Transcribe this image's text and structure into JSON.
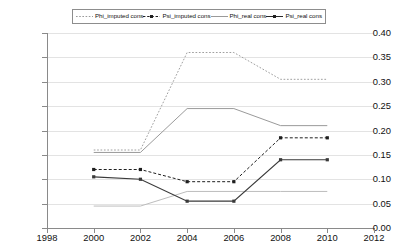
{
  "chart_data": {
    "type": "line",
    "title": "",
    "xlabel": "",
    "ylabel": "",
    "x": [
      2000,
      2002,
      2004,
      2006,
      2008,
      2010
    ],
    "xlim": [
      1998,
      2012
    ],
    "ylim": [
      0.0,
      0.4
    ],
    "xticks": [
      "1998",
      "2000",
      "2002",
      "2004",
      "2006",
      "2008",
      "2010",
      "2012"
    ],
    "xtick_values": [
      1998,
      2000,
      2002,
      2004,
      2006,
      2008,
      2010,
      2012
    ],
    "yticks": [
      "0.00",
      "0.05",
      "0.10",
      "0.15",
      "0.20",
      "0.25",
      "0.30",
      "0.35",
      "0.40"
    ],
    "ytick_values": [
      0.0,
      0.05,
      0.1,
      0.15,
      0.2,
      0.25,
      0.3,
      0.35,
      0.4
    ],
    "grid": true,
    "legend_position": "top-center",
    "series": [
      {
        "name": "Phi_imputed cons",
        "style": "dotted",
        "color": "#a0a0a0",
        "marker": "none",
        "values": [
          0.16,
          0.16,
          0.36,
          0.36,
          0.305,
          0.305
        ]
      },
      {
        "name": "Psi_imputed cons",
        "style": "dashed",
        "color": "#1f1f1f",
        "marker": "square",
        "values": [
          0.12,
          0.12,
          0.095,
          0.095,
          0.185,
          0.185
        ]
      },
      {
        "name": "Phi_real cons",
        "style": "solid-light",
        "color": "#bdbdbd",
        "marker": "none",
        "values": [
          0.045,
          0.045,
          0.075,
          0.075,
          0.075,
          0.075
        ]
      },
      {
        "name": "Psi_real cons",
        "style": "solid",
        "color": "#3a3a3a",
        "marker": "square",
        "values": [
          0.105,
          0.1,
          0.055,
          0.055,
          0.14,
          0.14
        ]
      },
      {
        "name": "Phi_real cons upper",
        "style": "solid-mid",
        "color": "#9a9a9a",
        "marker": "none",
        "values": [
          0.155,
          0.155,
          0.245,
          0.245,
          0.21,
          0.21
        ]
      }
    ]
  },
  "legend": {
    "items": [
      {
        "label": "Phi_imputed cons",
        "swatch": "dotted-gray"
      },
      {
        "label": "Psi_imputed cons",
        "swatch": "dashed-black-marker"
      },
      {
        "label": "Phi_real cons",
        "swatch": "solid-gray"
      },
      {
        "label": "Psi_real cons",
        "swatch": "solid-black-marker"
      }
    ]
  }
}
